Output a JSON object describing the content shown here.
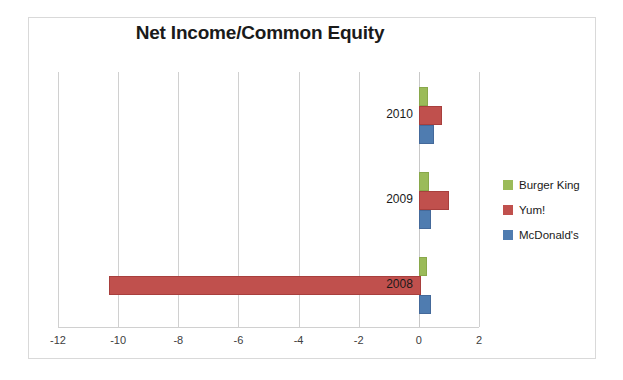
{
  "chart_data": {
    "type": "bar",
    "orientation": "horizontal",
    "title": "Net Income/Common Equity",
    "xlabel": "",
    "ylabel": "",
    "categories": [
      "2010",
      "2009",
      "2008"
    ],
    "xlim": [
      -12,
      2
    ],
    "xticks": [
      -12,
      -10,
      -8,
      -6,
      -4,
      -2,
      0,
      2
    ],
    "xtick_labels": [
      "-12",
      "-10",
      "-8",
      "-6",
      "-4",
      "-2",
      "0",
      "2"
    ],
    "grid": true,
    "legend_position": "right",
    "series": [
      {
        "name": "Burger King",
        "color": "#9bbb59",
        "values": [
          0.25,
          0.27,
          0.2
        ]
      },
      {
        "name": "Yum!",
        "color": "#c0504d",
        "values": [
          0.7,
          0.95,
          -10.3
        ]
      },
      {
        "name": "McDonald's",
        "color": "#4f7cb0",
        "values": [
          0.45,
          0.35,
          0.33
        ]
      }
    ]
  },
  "legend": {
    "entries": [
      {
        "label": "Burger King"
      },
      {
        "label": "Yum!"
      },
      {
        "label": "McDonald's"
      }
    ]
  }
}
